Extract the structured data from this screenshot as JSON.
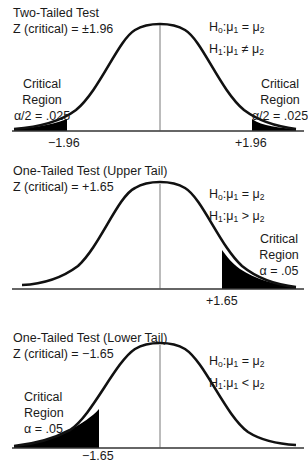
{
  "panels": [
    {
      "title": "Two-Tailed Test",
      "z_critical": "Z (critical) = ±1.96",
      "h0": {
        "lhs": "H",
        "lhs_sub": "o",
        "mid": ":μ",
        "mid_sub": "1",
        "op": " = ",
        "rhs": "μ",
        "rhs_sub": "2"
      },
      "h1": {
        "lhs": "H",
        "lhs_sub": "1",
        "mid": ":μ",
        "mid_sub": "1",
        "op": " ≠ ",
        "rhs": "μ",
        "rhs_sub": "2"
      },
      "left_region": {
        "line1": "Critical",
        "line2": "Region",
        "line3": "α/2 = .025"
      },
      "right_region": {
        "line1": "Critical",
        "line2": "Region",
        "line3": "α/2 = .025"
      },
      "left_tick": "−1.96",
      "right_tick": "+1.96"
    },
    {
      "title": "One-Tailed Test (Upper Tail)",
      "z_critical": "Z (critical) = +1.65",
      "h0": {
        "lhs": "H",
        "lhs_sub": "o",
        "mid": ":μ",
        "mid_sub": "1",
        "op": " = ",
        "rhs": "μ",
        "rhs_sub": "2"
      },
      "h1": {
        "lhs": "H",
        "lhs_sub": "1",
        "mid": ":μ",
        "mid_sub": "1",
        "op": " > ",
        "rhs": "μ",
        "rhs_sub": "2"
      },
      "right_region": {
        "line1": "Critical",
        "line2": "Region",
        "line3": "α = .05"
      },
      "right_tick": "+1.65"
    },
    {
      "title": "One-Tailed Test (Lower Tail)",
      "z_critical": "Z (critical) = −1.65",
      "h0": {
        "lhs": "H",
        "lhs_sub": "o",
        "mid": ":μ",
        "mid_sub": "1",
        "op": " = ",
        "rhs": "μ",
        "rhs_sub": "2"
      },
      "h1": {
        "lhs": "H",
        "lhs_sub": "1",
        "mid": ":μ",
        "mid_sub": "1",
        "op": " < ",
        "rhs": "μ",
        "rhs_sub": "2"
      },
      "left_region": {
        "line1": "Critical",
        "line2": "Region",
        "line3": "α = .05"
      },
      "left_tick": "−1.65"
    }
  ],
  "colors": {
    "curve": "#111111",
    "shade": "#000000",
    "axis": "#333333",
    "text": "#1a1a1a"
  }
}
